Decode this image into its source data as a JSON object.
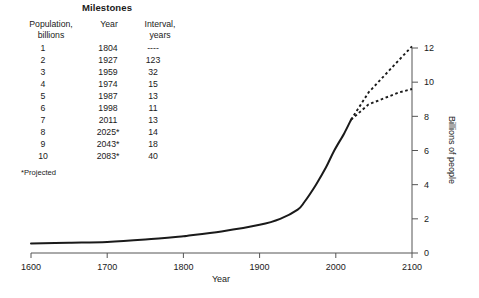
{
  "table": {
    "title": "Milestones",
    "headers": {
      "population": [
        "Population,",
        "billions"
      ],
      "year": [
        "Year",
        ""
      ],
      "interval": [
        "Interval,",
        "years"
      ]
    },
    "rows": [
      {
        "population": "1",
        "year": "1804",
        "interval": "----"
      },
      {
        "population": "2",
        "year": "1927",
        "interval": "123"
      },
      {
        "population": "3",
        "year": "1959",
        "interval": "32"
      },
      {
        "population": "4",
        "year": "1974",
        "interval": "15"
      },
      {
        "population": "5",
        "year": "1987",
        "interval": "13"
      },
      {
        "population": "6",
        "year": "1998",
        "interval": "11"
      },
      {
        "population": "7",
        "year": "2011",
        "interval": "13"
      },
      {
        "population": "8",
        "year": "2025*",
        "interval": "14"
      },
      {
        "population": "9",
        "year": "2043*",
        "interval": "18"
      },
      {
        "population": "10",
        "year": "2083*",
        "interval": "40"
      }
    ],
    "footnote": "*Projected"
  },
  "chart_data": {
    "type": "line",
    "title": "",
    "xlabel": "Year",
    "ylabel": "Billions of people",
    "xlim": [
      1600,
      2100
    ],
    "ylim": [
      0,
      12
    ],
    "xticks": [
      1600,
      1700,
      1800,
      1900,
      2000,
      2100
    ],
    "xticklabels": [
      "1600",
      "1700",
      "1800",
      "1900",
      "2000",
      "2100"
    ],
    "yticks": [
      0,
      2,
      4,
      6,
      8,
      10,
      12
    ],
    "yticklabels": [
      "0",
      "2",
      "4",
      "6",
      "8",
      "10",
      "12"
    ],
    "y_axis_side": "right",
    "grid": false,
    "legend": false,
    "series": [
      {
        "name": "Historical population",
        "style": "solid",
        "x": [
          1600,
          1650,
          1700,
          1750,
          1800,
          1804,
          1850,
          1900,
          1927,
          1950,
          1959,
          1974,
          1987,
          1998,
          2011,
          2020
        ],
        "y": [
          0.55,
          0.6,
          0.65,
          0.79,
          0.98,
          1.0,
          1.26,
          1.65,
          2.0,
          2.54,
          3.0,
          4.0,
          5.0,
          6.0,
          7.0,
          7.8
        ]
      },
      {
        "name": "High projection",
        "style": "dashed",
        "x": [
          2020,
          2043,
          2083,
          2100
        ],
        "y": [
          7.8,
          9.4,
          11.3,
          12.1
        ]
      },
      {
        "name": "Low projection",
        "style": "dashed",
        "x": [
          2020,
          2043,
          2083,
          2100
        ],
        "y": [
          7.8,
          8.7,
          9.4,
          9.6
        ]
      }
    ]
  },
  "colors": {
    "line": "#1a1a1a",
    "axis": "#555555",
    "background": "#ffffff"
  }
}
